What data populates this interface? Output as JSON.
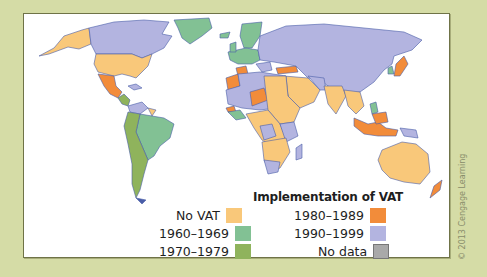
{
  "legend": {
    "title": "Implementation of VAT",
    "items": [
      {
        "label": "No VAT",
        "color": "#f9c87a"
      },
      {
        "label": "1960–1969",
        "color": "#82c194"
      },
      {
        "label": "1970–1979",
        "color": "#8fb35c"
      },
      {
        "label": "1980–1989",
        "color": "#f28c3a"
      },
      {
        "label": "1990–1999",
        "color": "#b3b4e0"
      },
      {
        "label": "No data",
        "color": "#a9a9a9"
      }
    ]
  },
  "copyright": "© 2013 Cengage Learning",
  "colors": {
    "background": "#d5dca6",
    "ocean": "#ffffff",
    "border": "#3f5aa8"
  }
}
